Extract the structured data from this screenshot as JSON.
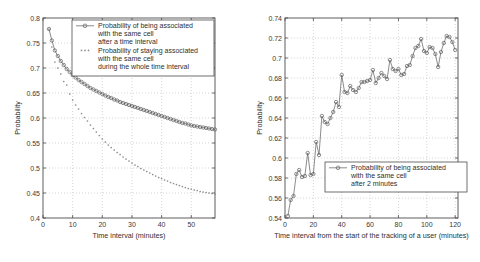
{
  "figure": {
    "panels": [
      {
        "id": "left",
        "legend": {
          "entries": [
            {
              "marker": "line-circle",
              "lines": [
                "Probability of being associated",
                "with the same cell",
                "after a time interval"
              ]
            },
            {
              "marker": "dotted",
              "lines": [
                "Probability of staying associated",
                "with the same cell",
                "during the whole time interval"
              ]
            }
          ]
        }
      },
      {
        "id": "right",
        "legend": {
          "entries": [
            {
              "marker": "line-circle",
              "lines": [
                "Probability of being associated",
                "with the same cell",
                "after 2 minutes"
              ]
            }
          ]
        }
      }
    ]
  },
  "chart_data": [
    {
      "type": "line",
      "id": "left-chart",
      "title": "",
      "xlabel": "Time interval (minutes)",
      "ylabel": "Probability",
      "xlim": [
        0,
        58
      ],
      "ylim": [
        0.4,
        0.8
      ],
      "xticks": [
        0,
        10,
        20,
        30,
        40,
        50
      ],
      "yticks": [
        0.4,
        0.45,
        0.5,
        0.55,
        0.6,
        0.65,
        0.7,
        0.75,
        0.8
      ],
      "xticklabels": [
        "0",
        "10",
        "20",
        "30",
        "40",
        "50"
      ],
      "yticklabels": [
        "0.4",
        "0.45",
        "0.5",
        "0.55",
        "0.6",
        "0.65",
        "0.7",
        "0.75",
        "0.8"
      ],
      "grid": true,
      "legend_position": "upper right",
      "series": [
        {
          "name": "Probability of being associated with the same cell after a time interval",
          "style": "solid-circles",
          "x": [
            2,
            3,
            4,
            5,
            6,
            7,
            8,
            9,
            10,
            11,
            12,
            13,
            14,
            15,
            16,
            17,
            18,
            19,
            20,
            21,
            22,
            23,
            24,
            25,
            26,
            27,
            28,
            29,
            30,
            31,
            32,
            33,
            34,
            35,
            36,
            37,
            38,
            39,
            40,
            41,
            42,
            43,
            44,
            45,
            46,
            47,
            48,
            49,
            50,
            51,
            52,
            53,
            54,
            55,
            56,
            57,
            58
          ],
          "values": [
            0.778,
            0.755,
            0.735,
            0.724,
            0.714,
            0.706,
            0.698,
            0.692,
            0.686,
            0.681,
            0.676,
            0.672,
            0.668,
            0.664,
            0.66,
            0.657,
            0.654,
            0.651,
            0.648,
            0.645,
            0.642,
            0.64,
            0.637,
            0.635,
            0.632,
            0.63,
            0.628,
            0.626,
            0.624,
            0.622,
            0.62,
            0.618,
            0.616,
            0.614,
            0.612,
            0.61,
            0.608,
            0.606,
            0.604,
            0.602,
            0.6,
            0.598,
            0.596,
            0.594,
            0.592,
            0.59,
            0.589,
            0.587,
            0.585,
            0.584,
            0.583,
            0.582,
            0.581,
            0.58,
            0.579,
            0.578,
            0.577
          ]
        },
        {
          "name": "Probability of staying associated with the same cell during the whole time interval",
          "style": "dotted",
          "x": [
            2,
            3,
            4,
            5,
            6,
            7,
            8,
            9,
            10,
            11,
            12,
            13,
            14,
            15,
            16,
            17,
            18,
            19,
            20,
            21,
            22,
            23,
            24,
            25,
            26,
            27,
            28,
            29,
            30,
            31,
            32,
            33,
            34,
            35,
            36,
            37,
            38,
            39,
            40,
            41,
            42,
            43,
            44,
            45,
            46,
            47,
            48,
            49,
            50,
            51,
            52,
            53,
            54,
            55,
            56,
            57,
            58
          ],
          "values": [
            0.778,
            0.742,
            0.712,
            0.7,
            0.688,
            0.673,
            0.666,
            0.648,
            0.636,
            0.626,
            0.618,
            0.609,
            0.601,
            0.594,
            0.586,
            0.579,
            0.572,
            0.565,
            0.558,
            0.552,
            0.546,
            0.541,
            0.536,
            0.531,
            0.527,
            0.522,
            0.518,
            0.514,
            0.51,
            0.506,
            0.503,
            0.499,
            0.496,
            0.493,
            0.49,
            0.487,
            0.484,
            0.481,
            0.479,
            0.476,
            0.474,
            0.471,
            0.469,
            0.467,
            0.465,
            0.463,
            0.461,
            0.459,
            0.458,
            0.456,
            0.455,
            0.453,
            0.452,
            0.451,
            0.45,
            0.449,
            0.448
          ]
        }
      ]
    },
    {
      "type": "line",
      "id": "right-chart",
      "title": "",
      "xlabel": "Time interval from the start of the tracking of a user (minutes)",
      "ylabel": "Probability",
      "xlim": [
        0,
        122
      ],
      "ylim": [
        0.54,
        0.74
      ],
      "xticks": [
        0,
        20,
        40,
        60,
        80,
        100,
        120
      ],
      "yticks": [
        0.54,
        0.56,
        0.58,
        0.6,
        0.62,
        0.64,
        0.66,
        0.68,
        0.7,
        0.72,
        0.74
      ],
      "xticklabels": [
        "0",
        "20",
        "40",
        "60",
        "80",
        "100",
        "120"
      ],
      "yticklabels": [
        "0.54",
        "0.56",
        "0.58",
        "0.6",
        "0.62",
        "0.64",
        "0.66",
        "0.68",
        "0.7",
        "0.72",
        "0.74"
      ],
      "grid": true,
      "legend_position": "lower right",
      "series": [
        {
          "name": "Probability of being associated with the same cell after 2 minutes",
          "style": "solid-circles",
          "x": [
            2,
            4,
            6,
            8,
            10,
            12,
            14,
            16,
            18,
            20,
            22,
            24,
            26,
            28,
            30,
            32,
            34,
            36,
            38,
            40,
            42,
            44,
            46,
            48,
            50,
            52,
            54,
            56,
            58,
            60,
            62,
            64,
            66,
            68,
            70,
            72,
            74,
            76,
            78,
            80,
            82,
            84,
            86,
            88,
            90,
            92,
            94,
            96,
            98,
            100,
            102,
            104,
            106,
            108,
            110,
            112,
            114,
            116,
            118,
            120
          ],
          "values": [
            0.542,
            0.558,
            0.562,
            0.584,
            0.588,
            0.581,
            0.582,
            0.605,
            0.583,
            0.584,
            0.616,
            0.603,
            0.642,
            0.636,
            0.634,
            0.64,
            0.646,
            0.656,
            0.651,
            0.683,
            0.666,
            0.665,
            0.672,
            0.668,
            0.666,
            0.67,
            0.676,
            0.676,
            0.677,
            0.678,
            0.688,
            0.675,
            0.68,
            0.685,
            0.682,
            0.679,
            0.698,
            0.689,
            0.687,
            0.689,
            0.683,
            0.684,
            0.692,
            0.693,
            0.702,
            0.71,
            0.712,
            0.719,
            0.707,
            0.705,
            0.711,
            0.71,
            0.704,
            0.691,
            0.706,
            0.715,
            0.722,
            0.721,
            0.716,
            0.708
          ]
        }
      ]
    }
  ]
}
